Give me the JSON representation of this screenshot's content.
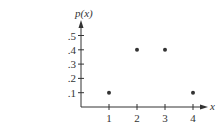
{
  "chart_data": {
    "type": "scatter",
    "title": "",
    "xlabel": "x",
    "ylabel": "p(x)",
    "x": [
      1,
      2,
      3,
      4
    ],
    "values": [
      0.1,
      0.4,
      0.4,
      0.1
    ],
    "series": [
      {
        "name": "p(x)",
        "x": [
          1,
          2,
          3,
          4
        ],
        "values": [
          0.1,
          0.4,
          0.4,
          0.1
        ]
      }
    ],
    "xticks": [
      "1",
      "2",
      "3",
      "4"
    ],
    "yticks": [
      ".1",
      ".2",
      ".3",
      ".4",
      ".5"
    ],
    "xlim": [
      0,
      4.5
    ],
    "ylim": [
      0,
      0.6
    ],
    "grid": false,
    "legend": null
  },
  "colors": {
    "axis": "#333333",
    "point": "#333333"
  }
}
